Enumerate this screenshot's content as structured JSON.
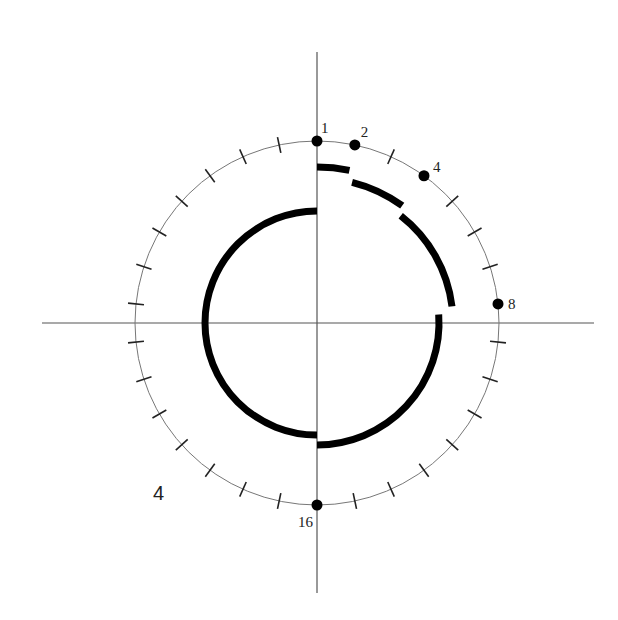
{
  "figure": {
    "panel_label": "4",
    "center": [
      317,
      323
    ],
    "axes": {
      "horizontal": {
        "x1": 42,
        "x2": 594
      },
      "vertical": {
        "y1": 52,
        "y2": 593
      },
      "color": "#555555"
    },
    "ring": {
      "radius": 182,
      "positions": 30,
      "step_degrees": 12,
      "color": "#777777",
      "tick_color": "#222222"
    },
    "markers": [
      {
        "label": "1",
        "index": 0
      },
      {
        "label": "2",
        "index": 1
      },
      {
        "label": "4",
        "index": 3
      },
      {
        "label": "8",
        "index": 7
      },
      {
        "label": "16",
        "index": 15
      }
    ],
    "spiral_segments": [
      {
        "radius": 156,
        "start_deg": 0,
        "end_deg": 12
      },
      {
        "radius": 145,
        "start_deg": 14,
        "end_deg": 36
      },
      {
        "radius": 136,
        "start_deg": 38,
        "end_deg": 83
      },
      {
        "radius": 122,
        "start_deg": 86,
        "end_deg": 180
      },
      {
        "radius": 112,
        "start_deg": 180,
        "end_deg": 360
      }
    ],
    "stroke_color": "#000000"
  }
}
